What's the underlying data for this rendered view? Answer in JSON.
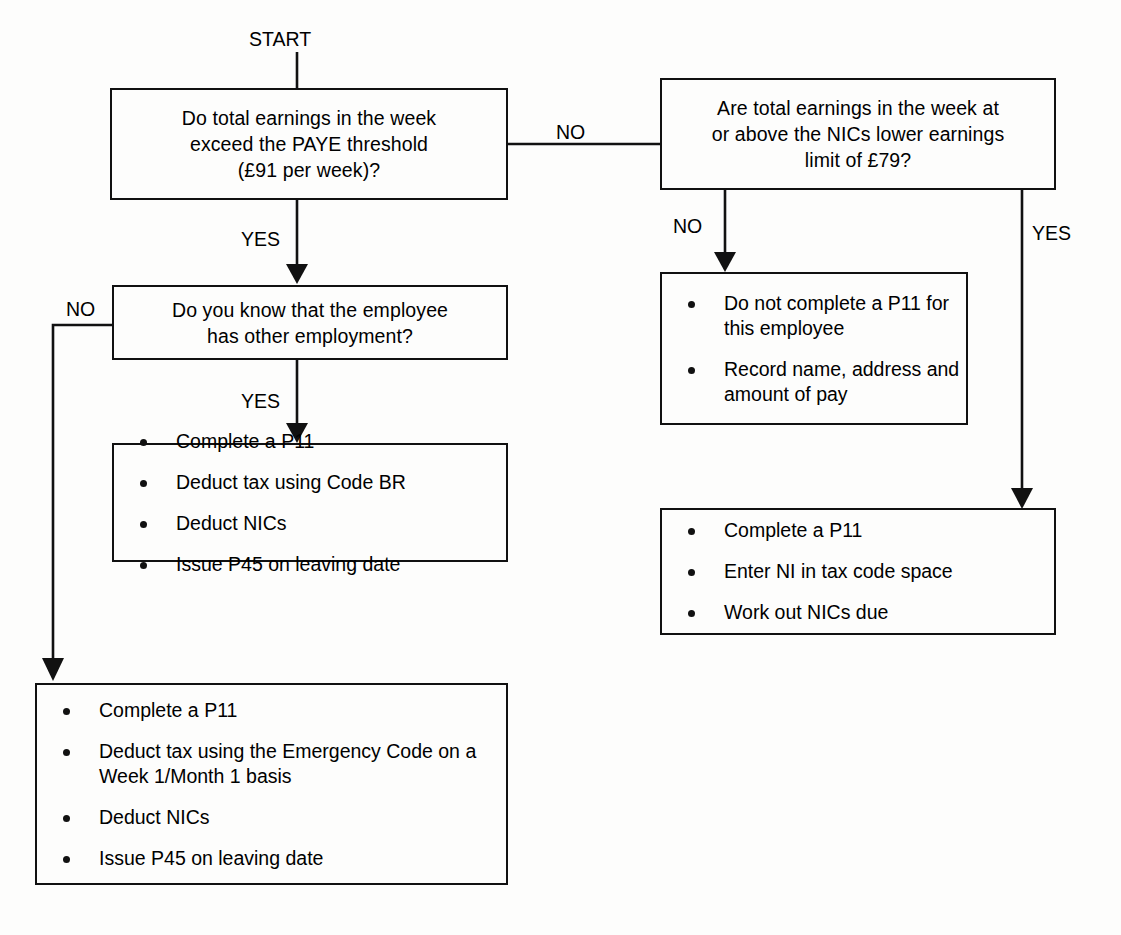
{
  "diagram": {
    "start_label": "START",
    "stroke_color": "#111111",
    "background_color": "#fdfdfc"
  },
  "nodes": {
    "decision_paye_threshold": {
      "lines": [
        "Do total earnings in the week",
        "exceed the PAYE threshold",
        "(£91 per week)?"
      ]
    },
    "decision_nics_lel": {
      "lines": [
        "Are total earnings in the week at",
        "or above the NICs lower earnings",
        "limit of £79?"
      ]
    },
    "decision_other_employment": {
      "lines": [
        "Do you know that the employee",
        "has other employment?"
      ]
    },
    "action_no_p11": {
      "bullets": [
        "Do not complete a P11 for this employee",
        "Record name, address and amount of pay"
      ]
    },
    "action_code_br": {
      "bullets": [
        "Complete a P11",
        "Deduct tax using Code BR",
        "Deduct NICs",
        "Issue P45 on leaving date"
      ]
    },
    "action_ni_code": {
      "bullets": [
        "Complete a P11",
        "Enter NI in tax code space",
        "Work out NICs due"
      ]
    },
    "action_emergency_code": {
      "bullets": [
        "Complete a P11",
        "Deduct tax using the Emergency Code on a Week 1/Month 1 basis",
        "Deduct NICs",
        "Issue P45 on leaving date"
      ]
    }
  },
  "edge_labels": {
    "paye_no": "NO",
    "paye_yes": "YES",
    "lel_no": "NO",
    "lel_yes": "YES",
    "other_employment_no": "NO",
    "other_employment_yes": "YES"
  }
}
